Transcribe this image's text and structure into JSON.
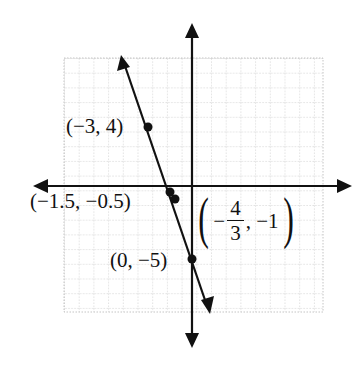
{
  "figure": {
    "type": "coordinate-plane-line-graph",
    "grid": {
      "visible": true,
      "style": "dotted",
      "color": "#b8b8b8"
    },
    "axes": {
      "color": "#111111",
      "x_arrows": true,
      "y_arrows": true
    },
    "line": {
      "description": "line through labeled points, slope -3",
      "color": "#111111"
    },
    "points": [
      {
        "id": "a",
        "label": "(−3, 4)",
        "x": -3,
        "y": 4
      },
      {
        "id": "b",
        "label": "(−1.5, −0.5)",
        "x": -1.5,
        "y": -0.5
      },
      {
        "id": "c",
        "label_minus": "−",
        "label_num": "4",
        "label_den": "3",
        "label_rest": ", −1",
        "label_open": "(",
        "label_close": ")",
        "x": -1.3333,
        "y": -1
      },
      {
        "id": "d",
        "label": "(0, −5)",
        "x": 0,
        "y": -5
      }
    ]
  }
}
